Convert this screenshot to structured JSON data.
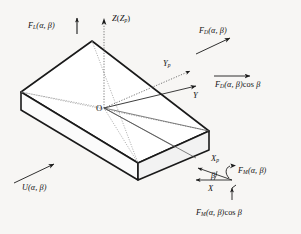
{
  "figure": {
    "origin_label": "O",
    "background_color": "#f7f6f4",
    "line_color": "#1a1a1a",
    "body": {
      "description": "rectangular flat plate drawn in isometric projection",
      "face_fill": "#ffffff",
      "top_fill": "#fdfdfd"
    }
  },
  "axes": [
    {
      "id": "z-axis",
      "label_main": "Z",
      "label_paren_open": "(",
      "label_sub_main": "Z",
      "label_sub_index": "p",
      "label_paren_close": ")",
      "label_full": "Z(Zp)",
      "style": "dotted",
      "direction": "up"
    },
    {
      "id": "y-axis",
      "label_main": "Y",
      "label_full": "Y",
      "style": "solid",
      "direction": "up-right"
    },
    {
      "id": "yp-axis",
      "label_main": "Y",
      "label_index": "p",
      "label_full": "Yp",
      "style": "dotted",
      "direction": "up-right-steep"
    },
    {
      "id": "x-axis",
      "label_main": "X",
      "label_full": "X",
      "style": "solid",
      "direction": "down-left"
    },
    {
      "id": "xp-axis",
      "label_main": "X",
      "label_index": "p",
      "label_full": "Xp",
      "style": "solid",
      "direction": "down-left-steep"
    }
  ],
  "angle": {
    "id": "beta-angle",
    "symbol": "β",
    "between": [
      "X",
      "Xp"
    ]
  },
  "forces": [
    {
      "id": "lift-force",
      "symbol": "F",
      "subscript": "L",
      "args": "(α, β)",
      "label_full": "FL(α, β)",
      "arrow": "up",
      "position": "top-left"
    },
    {
      "id": "drag-force",
      "symbol": "F",
      "subscript": "D",
      "args": "(α, β)",
      "label_full": "FD(α, β)",
      "arrow": "up-right",
      "position": "top-right"
    },
    {
      "id": "drag-force-component",
      "symbol": "F",
      "subscript": "D",
      "args": "(α, β)",
      "suffix": "cos β",
      "label_full": "FD(α, β)cos β",
      "arrow": "right",
      "position": "right"
    },
    {
      "id": "lateral-force",
      "symbol": "F",
      "subscript": "M",
      "args": "(α, β)",
      "label_full": "FM(α, β)",
      "arrow": "right-down",
      "position": "lower-right"
    },
    {
      "id": "lateral-force-component",
      "symbol": "F",
      "subscript": "M",
      "args": "(α, β)",
      "suffix": "cos β",
      "label_full": "FM(α, β)cos β",
      "arrow": "up",
      "position": "bottom-right"
    }
  ],
  "flow": {
    "id": "free-stream-velocity",
    "symbol": "U",
    "args": "(α, β)",
    "label_full": "U(α, β)",
    "arrow": "up-right",
    "position": "bottom-left"
  }
}
